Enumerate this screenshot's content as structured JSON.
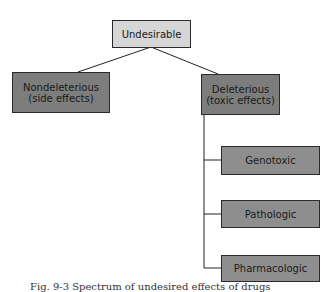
{
  "diagram": {
    "root": {
      "label": "Undesirable",
      "color": "#d6d6d6"
    },
    "branches": [
      {
        "label_line1": "Nondeleterious",
        "label_line2": "(side effects)",
        "color": "#7d7d7d"
      },
      {
        "label_line1": "Deleterious",
        "label_line2": "(toxic effects)",
        "color": "#7d7d7d"
      }
    ],
    "deleterious_children": [
      {
        "label": "Genotoxic"
      },
      {
        "label": "Pathologic"
      },
      {
        "label": "Pharmacologic"
      }
    ]
  },
  "caption": "Fig. 9-3 Spectrum of undesired effects of drugs"
}
